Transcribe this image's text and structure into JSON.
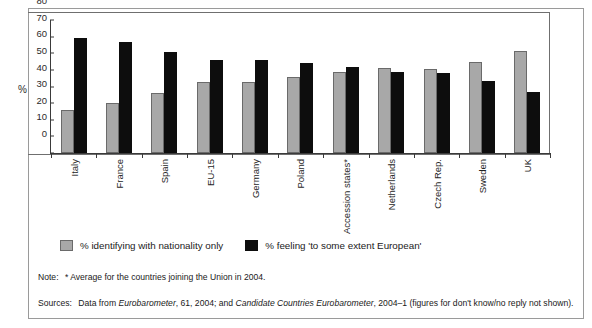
{
  "chart_data": {
    "type": "bar",
    "title": "",
    "xlabel": "",
    "ylabel": "%",
    "ylim": [
      0,
      80
    ],
    "yticks": [
      0,
      10,
      20,
      30,
      40,
      50,
      60,
      70,
      80
    ],
    "grid": false,
    "legend_position": "bottom",
    "categories": [
      "Italy",
      "France",
      "Spain",
      "EU-15",
      "Germany",
      "Poland",
      "Accession states*",
      "Netherlands",
      "Czech Rep.",
      "Sweden",
      "UK"
    ],
    "series": [
      {
        "name": "% identifying with nationality only",
        "color": "#a8a8a8",
        "values": [
          26,
          30,
          36,
          42.5,
          43,
          46,
          48.5,
          51,
          50.5,
          55,
          61.5
        ]
      },
      {
        "name": "% feeling 'to some extent European'",
        "color": "#0d0d0d",
        "values": [
          69,
          67,
          61,
          56,
          56,
          54,
          51.5,
          48.5,
          48,
          43.5,
          36.5
        ]
      }
    ]
  },
  "notes": {
    "note_label": "Note:",
    "note_text": "* Average for the countries joining the Union in 2004.",
    "sources_label": "Sources:",
    "sources_pre": "Data from",
    "sources_italic_1": "Eurobarometer",
    "sources_mid": ", 61, 2004; and",
    "sources_italic_2": "Candidate Countries Eurobarometer",
    "sources_post": ", 2004–1 (figures for don't know/no reply not shown)."
  }
}
